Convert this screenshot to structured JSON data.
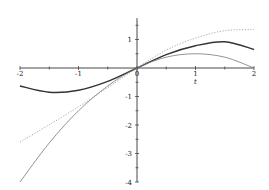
{
  "chart_data": {
    "type": "line",
    "title": "",
    "xlabel": "t",
    "ylabel": "",
    "xlim": [
      -2,
      2
    ],
    "ylim": [
      -4,
      1.75
    ],
    "grid": false,
    "legend": null,
    "x_ticks": [
      -2,
      -1,
      0,
      1,
      2
    ],
    "x_tick_labels": [
      "-2",
      "-1",
      "0",
      "1",
      "2"
    ],
    "y_ticks": [
      1,
      -1,
      -2,
      -3,
      -4
    ],
    "y_tick_labels": [
      "1",
      "-1",
      "-2",
      "-3",
      "-4"
    ],
    "x": [
      -2,
      -1.5,
      -1,
      -0.5,
      0,
      0.5,
      1,
      1.5,
      2
    ],
    "series": [
      {
        "name": "dark solid curve",
        "style": "solid",
        "color": "#333333",
        "width": 1.4,
        "values": [
          -0.63,
          -0.85,
          -0.78,
          -0.47,
          0,
          0.47,
          0.78,
          0.92,
          0.65
        ]
      },
      {
        "name": "light gray dotted curve",
        "style": "dotted",
        "color": "#aaaaaa",
        "width": 1.0,
        "values": [
          -2.6,
          -1.99,
          -1.36,
          -0.69,
          0,
          0.63,
          1.05,
          1.31,
          1.35
        ]
      },
      {
        "name": "thin solid curve",
        "style": "solid",
        "color": "#777777",
        "width": 0.8,
        "values": [
          -4.0,
          -2.63,
          -1.5,
          -0.63,
          0,
          0.38,
          0.5,
          0.38,
          0.0
        ]
      }
    ]
  },
  "axes": {
    "x_label": "t",
    "tick_labels_x": [
      "-2",
      "-1",
      "0",
      "1",
      "2"
    ],
    "tick_labels_y": [
      "1",
      "-1",
      "-2",
      "-3",
      "-4"
    ]
  }
}
